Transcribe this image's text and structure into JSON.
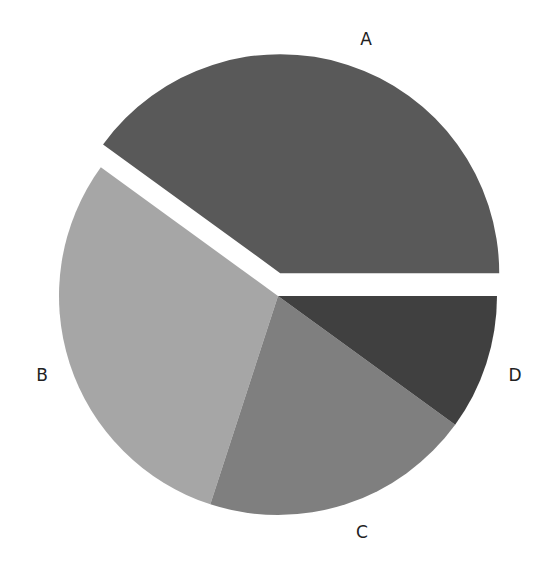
{
  "chart_data": {
    "type": "pie",
    "title": "",
    "xlabel": "",
    "ylabel": "",
    "legend": "none",
    "grid": false,
    "categories": [
      "A",
      "B",
      "C",
      "D"
    ],
    "values": [
      40,
      30,
      20,
      10
    ],
    "colors": [
      "#595959",
      "#a6a6a6",
      "#7f7f7f",
      "#404040"
    ],
    "exploded": [
      "A"
    ],
    "start_angle_deg": 0,
    "direction": "counterclockwise",
    "labels_position": "outside"
  },
  "labels": {
    "a": "A",
    "b": "B",
    "c": "C",
    "d": "D"
  }
}
